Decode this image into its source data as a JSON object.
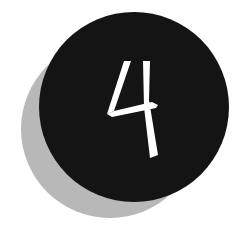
{
  "badge": {
    "number": "4",
    "label": "number-four-badge",
    "colors": {
      "background": "#ffffff",
      "circle": "#141414",
      "shadow": "#b8b8b8",
      "numeral": "#ffffff"
    }
  }
}
